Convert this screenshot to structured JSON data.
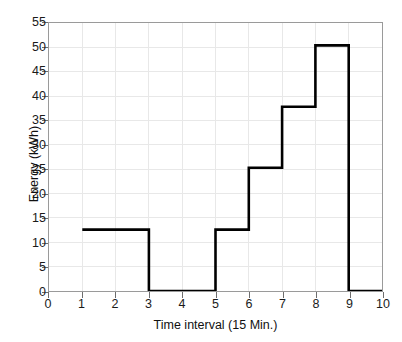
{
  "chart_data": {
    "type": "line",
    "subtype": "step-post",
    "title": "",
    "xlabel": "Time interval (15 Min.)",
    "ylabel": "Energy (kWh)",
    "xlim": [
      0,
      10
    ],
    "ylim": [
      0,
      55
    ],
    "xticks": [
      0,
      1,
      2,
      3,
      4,
      5,
      6,
      7,
      8,
      9,
      10
    ],
    "yticks": [
      0,
      5,
      10,
      15,
      20,
      25,
      30,
      35,
      40,
      45,
      50,
      55
    ],
    "grid": true,
    "legend": null,
    "line_color": "#000000",
    "grid_color": "#e8e8e8",
    "axis_color": "#9a9a9a",
    "x": [
      1,
      2,
      3,
      4,
      5,
      6,
      7,
      8,
      9,
      10
    ],
    "values": [
      12.6,
      12.6,
      0,
      0,
      12.6,
      25.3,
      37.8,
      50.4,
      0,
      0
    ],
    "steps": [
      {
        "x_start": 1,
        "x_end": 3,
        "value": 12.6
      },
      {
        "x_start": 3,
        "x_end": 5,
        "value": 0
      },
      {
        "x_start": 5,
        "x_end": 6,
        "value": 12.6
      },
      {
        "x_start": 6,
        "x_end": 7,
        "value": 25.3
      },
      {
        "x_start": 7,
        "x_end": 8,
        "value": 37.8
      },
      {
        "x_start": 8,
        "x_end": 9,
        "value": 50.4
      },
      {
        "x_start": 9,
        "x_end": 10,
        "value": 0
      }
    ]
  },
  "axes": {
    "y_title": "Energy (kWh)",
    "x_title": "Time interval (15 Min.)",
    "y_tick_labels": [
      "0",
      "5",
      "10",
      "15",
      "20",
      "25",
      "30",
      "35",
      "40",
      "45",
      "50",
      "55"
    ],
    "x_tick_labels": [
      "0",
      "1",
      "2",
      "3",
      "4",
      "5",
      "6",
      "7",
      "8",
      "9",
      "10"
    ]
  }
}
